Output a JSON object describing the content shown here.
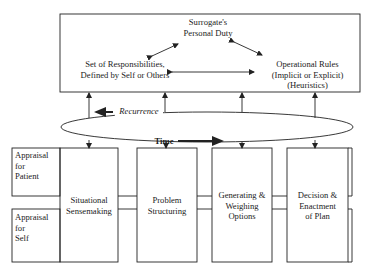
{
  "diagram": {
    "top_box": {
      "personal_duty": [
        "Surrogate's",
        "Personal Duty"
      ],
      "responsibilities": [
        "Set of Responsibilities,",
        "Defined by Self or Others"
      ],
      "operational_rules": [
        "Operational Rules",
        "(Implicit or Explicit)",
        "(Heuristics)"
      ]
    },
    "loop": {
      "recurrence_label": "Recurrence",
      "time_label": "Time"
    },
    "appraisals": [
      {
        "lines": [
          "Appraisal",
          "for",
          "Patient"
        ]
      },
      {
        "lines": [
          "Appraisal",
          "for",
          "Self"
        ]
      }
    ],
    "stages": [
      {
        "lines": [
          "Situational",
          "Sensemaking"
        ]
      },
      {
        "lines": [
          "Problem",
          "Structuring"
        ]
      },
      {
        "lines": [
          "Generating &",
          "Weighing",
          "Options"
        ]
      },
      {
        "lines": [
          "Decision &",
          "Enactment",
          "of Plan"
        ]
      }
    ],
    "colors": {
      "line": "#222222",
      "background": "#ffffff"
    }
  }
}
